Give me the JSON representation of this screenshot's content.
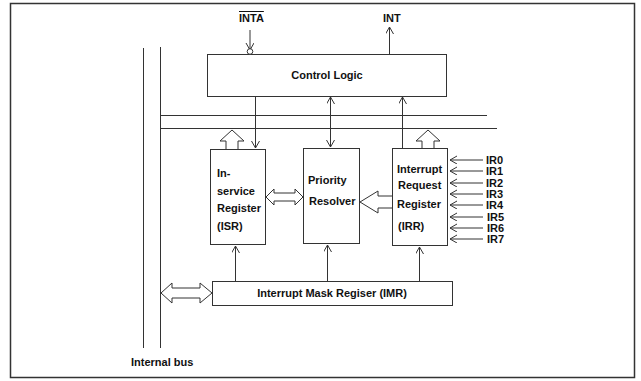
{
  "diagram": {
    "signals": {
      "inta": "INTA",
      "int": "INT"
    },
    "blocks": {
      "control_logic": "Control Logic",
      "isr": [
        "In-",
        "service",
        "Register",
        "(ISR)"
      ],
      "priority_resolver": [
        "Priority",
        "Resolver"
      ],
      "irr": [
        "Interrupt",
        "Request",
        "Register",
        "(IRR)"
      ],
      "imr": "Interrupt Mask Regiser (IMR)"
    },
    "interrupt_inputs": [
      "IR0",
      "IR1",
      "IR2",
      "IR3",
      "IR4",
      "IR5",
      "IR6",
      "IR7"
    ],
    "bus_label": "Internal bus",
    "colors": {
      "stroke": "#333333",
      "text": "#111111",
      "background": "#ffffff"
    }
  }
}
